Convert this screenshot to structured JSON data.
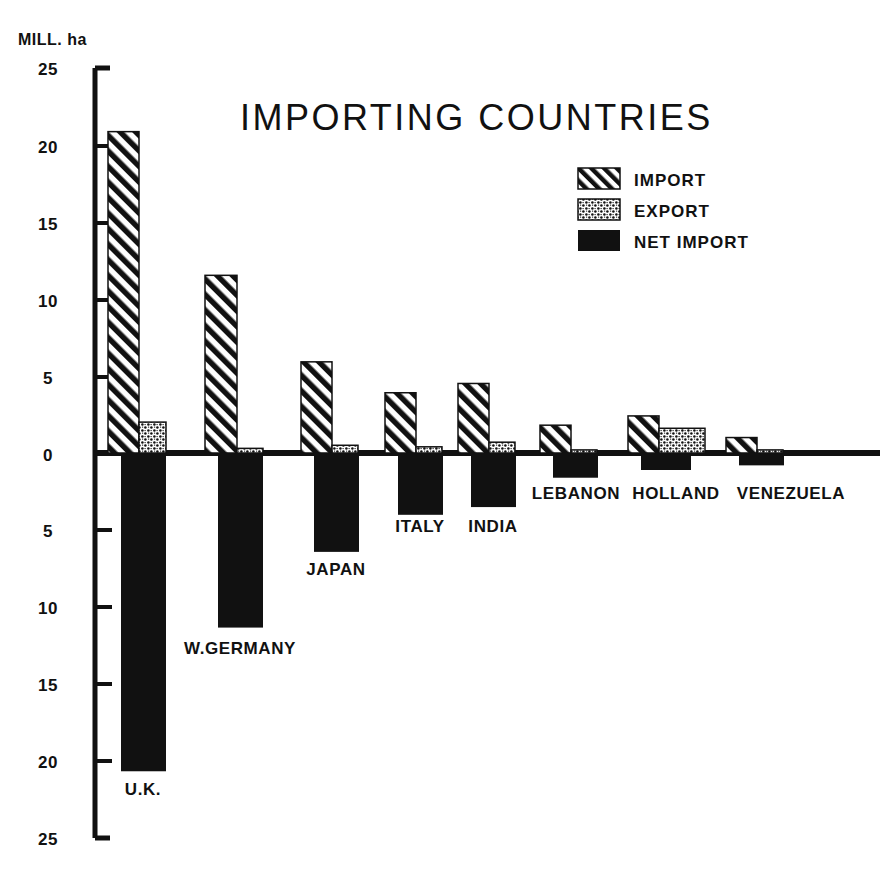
{
  "chart_data": {
    "type": "bar",
    "title": "IMPORTING COUNTRIES",
    "subtitle": "",
    "ylabel": "MILL. ha",
    "xlabel": "",
    "grid": false,
    "legend_position": "top-right",
    "axis_note": "Y axis is mirrored about zero: values above zero are import/export, values below zero are net import; tick labels are absolute values.",
    "ylim": [
      -25,
      25
    ],
    "yticks_above": [
      0,
      5,
      10,
      15,
      20,
      25
    ],
    "yticks_below": [
      5,
      10,
      15,
      20,
      25
    ],
    "ytick_labels": [
      "25",
      "20",
      "15",
      "10",
      "5",
      "0",
      "5",
      "10",
      "15",
      "20",
      "25"
    ],
    "categories": [
      "U.K.",
      "W.GERMANY",
      "JAPAN",
      "ITALY",
      "INDIA",
      "LEBANON",
      "HOLLAND",
      "VENEZUELA"
    ],
    "series": [
      {
        "name": "IMPORT",
        "pattern": "diagonal-hatch",
        "values": [
          20.8,
          11.5,
          5.9,
          3.9,
          4.5,
          1.8,
          2.4,
          1.0
        ]
      },
      {
        "name": "EXPORT",
        "pattern": "stipple",
        "values": [
          2.0,
          0.3,
          0.5,
          0.4,
          0.7,
          0.2,
          1.6,
          0.2
        ]
      },
      {
        "name": "NET IMPORT",
        "pattern": "solid",
        "values": [
          20.6,
          11.3,
          6.4,
          4.0,
          3.5,
          1.6,
          1.1,
          0.8
        ]
      }
    ]
  },
  "chart": {
    "title": "IMPORTING COUNTRIES",
    "y_unit": "MILL. ha"
  },
  "y_ticks": [
    {
      "label": "25",
      "value": 25,
      "side": "above"
    },
    {
      "label": "20",
      "value": 20,
      "side": "above"
    },
    {
      "label": "15",
      "value": 15,
      "side": "above"
    },
    {
      "label": "10",
      "value": 10,
      "side": "above"
    },
    {
      "label": "5",
      "value": 5,
      "side": "above"
    },
    {
      "label": "0",
      "value": 0,
      "side": "zero"
    },
    {
      "label": "5",
      "value": -5,
      "side": "below"
    },
    {
      "label": "10",
      "value": -10,
      "side": "below"
    },
    {
      "label": "15",
      "value": -15,
      "side": "below"
    },
    {
      "label": "20",
      "value": -20,
      "side": "below"
    },
    {
      "label": "25",
      "value": -25,
      "side": "below"
    }
  ],
  "legend": {
    "items": [
      {
        "label": "IMPORT",
        "pattern": "diagonal-hatch"
      },
      {
        "label": "EXPORT",
        "pattern": "stipple"
      },
      {
        "label": "NET IMPORT",
        "pattern": "solid"
      }
    ]
  },
  "categories": [
    {
      "label": "U.K.",
      "import": 20.8,
      "export": 2.0,
      "net_import": 20.6
    },
    {
      "label": "W.GERMANY",
      "import": 11.5,
      "export": 0.3,
      "net_import": 11.3
    },
    {
      "label": "JAPAN",
      "import": 5.9,
      "export": 0.5,
      "net_import": 6.4
    },
    {
      "label": "ITALY",
      "import": 3.9,
      "export": 0.4,
      "net_import": 4.0
    },
    {
      "label": "INDIA",
      "import": 4.5,
      "export": 0.7,
      "net_import": 3.5
    },
    {
      "label": "LEBANON",
      "import": 1.8,
      "export": 0.2,
      "net_import": 1.6
    },
    {
      "label": "HOLLAND",
      "import": 2.4,
      "export": 1.6,
      "net_import": 1.1
    },
    {
      "label": "VENEZUELA",
      "import": 1.0,
      "export": 0.2,
      "net_import": 0.8
    }
  ],
  "colors": {
    "ink": "#111111",
    "background": "#ffffff"
  }
}
